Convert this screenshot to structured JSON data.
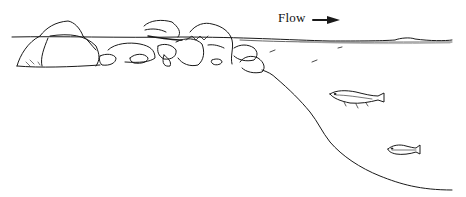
{
  "figure": {
    "type": "stream-cross-section-illustration",
    "flow_label": "Flow",
    "flow_arrow_icon": "arrow-right",
    "ink_color": "#1a1a1a",
    "background": "#ffffff",
    "elements": [
      "water-surface",
      "boulder-bank",
      "sloping-streambed",
      "fish-upper",
      "fish-lower"
    ]
  }
}
